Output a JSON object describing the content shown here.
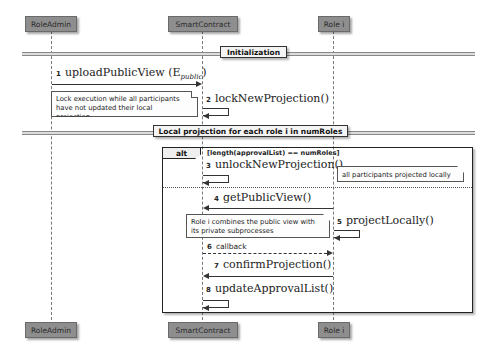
{
  "participants": {
    "role_admin": "RoleAdmin",
    "smart_contract": "SmartContract",
    "role_i": "Role i"
  },
  "dividers": {
    "initialization": "Initialization",
    "local_projection": "Local projection for each role i in numRoles"
  },
  "messages": [
    {
      "num": "1",
      "label": "uploadPublicView (E",
      "subscript": "public",
      "suffix": ")",
      "from": "RoleAdmin",
      "to": "SmartContract"
    },
    {
      "num": "2",
      "label": "lockNewProjection()",
      "from": "SmartContract",
      "to": "SmartContract"
    },
    {
      "num": "3",
      "label": "unlockNewProjection()",
      "from": "SmartContract",
      "to": "SmartContract"
    },
    {
      "num": "4",
      "label": "getPublicView()",
      "from": "Role i",
      "to": "SmartContract"
    },
    {
      "num": "5",
      "label": "projectLocally()",
      "from": "Role i",
      "to": "Role i"
    },
    {
      "num": "6",
      "label": "callback",
      "from": "SmartContract",
      "to": "Role i",
      "style": "dashed"
    },
    {
      "num": "7",
      "label": "confirmProjection()",
      "from": "Role i",
      "to": "SmartContract"
    },
    {
      "num": "8",
      "label": "updateApprovalList()",
      "from": "SmartContract",
      "to": "SmartContract"
    }
  ],
  "notes": {
    "lock": [
      "Lock execution while all participants",
      "have not updated their local projection"
    ],
    "all_projected": "all participants projected locally",
    "combines": [
      "Role i combines the public view with",
      "its private subprocesses"
    ]
  },
  "alt": {
    "tag": "alt",
    "guard": "[length(approvalList) == numRoles]"
  }
}
